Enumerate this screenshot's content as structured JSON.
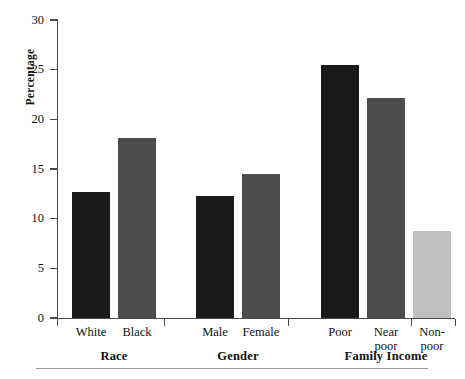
{
  "chart_data": {
    "type": "bar",
    "title": "",
    "subtitle": "",
    "xlabel": "",
    "ylabel": "Percentage",
    "ylim": [
      0,
      30
    ],
    "yticks": [
      0,
      5,
      10,
      15,
      20,
      25,
      30
    ],
    "ytick_labels": [
      "0",
      "5",
      "10",
      "15",
      "20",
      "25",
      "30"
    ],
    "grid": false,
    "legend": false,
    "legend_position": "none",
    "groups": [
      {
        "label": "Race",
        "categories": [
          "White",
          "Black"
        ],
        "values": [
          12.7,
          18.1
        ],
        "colors": [
          "#1a1a1a",
          "#4d4d4d"
        ]
      },
      {
        "label": "Gender",
        "categories": [
          "Male",
          "Female"
        ],
        "values": [
          12.3,
          14.5
        ],
        "colors": [
          "#1a1a1a",
          "#4d4d4d"
        ]
      },
      {
        "label": "Family Income",
        "categories": [
          "Poor",
          "Near poor",
          "Non-poor"
        ],
        "values": [
          25.5,
          22.1,
          8.8
        ],
        "colors": [
          "#1a1a1a",
          "#4d4d4d",
          "#bfbfbf"
        ]
      }
    ],
    "categories": [
      "White",
      "Black",
      "Male",
      "Female",
      "Poor",
      "Near poor",
      "Non-poor"
    ],
    "values": [
      12.7,
      18.1,
      12.3,
      14.5,
      25.5,
      22.1,
      8.8
    ],
    "colors": {
      "black_series": "#1a1a1a",
      "dark_gray_series": "#4d4d4d",
      "light_gray_series": "#bfbfbf",
      "axis": "#4a4a4a",
      "rule": "#9a9a9a",
      "background": "#ffffff",
      "text": "#111111"
    }
  },
  "axis": {
    "y_label": "Percentage",
    "ticks": [
      "30",
      "25",
      "20",
      "15",
      "10",
      "5",
      "0"
    ]
  },
  "bars": [
    {
      "name": "white",
      "label": "White",
      "value": 12.7,
      "color": "#1a1a1a",
      "x": 72,
      "width": 38,
      "label_lines": [
        "White"
      ]
    },
    {
      "name": "black",
      "label": "Black",
      "value": 18.1,
      "color": "#4d4d4d",
      "x": 118,
      "width": 38,
      "label_lines": [
        "Black"
      ]
    },
    {
      "name": "male",
      "label": "Male",
      "value": 12.3,
      "color": "#1a1a1a",
      "x": 196,
      "width": 38,
      "label_lines": [
        "Male"
      ]
    },
    {
      "name": "female",
      "label": "Female",
      "value": 14.5,
      "color": "#4d4d4d",
      "x": 242,
      "width": 38,
      "label_lines": [
        "Female"
      ]
    },
    {
      "name": "poor",
      "label": "Poor",
      "value": 25.5,
      "color": "#1a1a1a",
      "x": 321,
      "width": 38,
      "label_lines": [
        "Poor"
      ]
    },
    {
      "name": "near-poor",
      "label": "Near poor",
      "value": 22.1,
      "color": "#4d4d4d",
      "x": 367,
      "width": 38,
      "label_lines": [
        "Near",
        "poor"
      ]
    },
    {
      "name": "non-poor",
      "label": "Non-poor",
      "value": 8.8,
      "color": "#bfbfbf",
      "x": 413,
      "width": 38,
      "label_lines": [
        "Non-",
        "poor"
      ]
    }
  ],
  "groups": [
    {
      "name": "race",
      "label": "Race",
      "center": 114
    },
    {
      "name": "gender",
      "label": "Gender",
      "center": 238
    },
    {
      "name": "family-income",
      "label": "Family Income",
      "center": 386
    }
  ]
}
